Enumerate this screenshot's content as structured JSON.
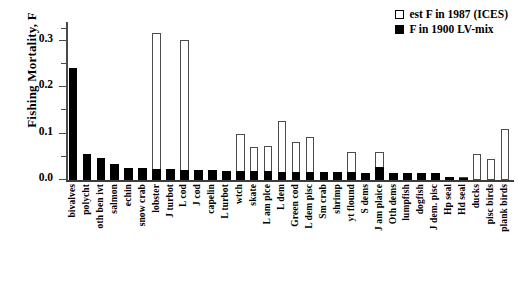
{
  "chart_data": {
    "type": "bar",
    "title": "",
    "xlabel": "",
    "ylabel": "Fishing Mortality, F",
    "ylim": [
      0,
      0.34
    ],
    "grid": false,
    "legend_position": "top-right",
    "ytick_labels": [
      "0.0",
      "0.1",
      "0.2",
      "0.3"
    ],
    "ytick_values": [
      0.0,
      0.1,
      0.2,
      0.3
    ],
    "categories": [
      "bivalves",
      "polycht",
      "oth ben ivt",
      "salmon",
      "echin",
      "snow crab",
      "lobster",
      "J turbot",
      "L cod",
      "J cod",
      "capelin",
      "L turbot",
      "wtch",
      "skate",
      "L am plce",
      "L dem",
      "Green cod",
      "L dem pisc",
      "Sm crab",
      "shrimp",
      "yt flound",
      "S dems",
      "J am plaice",
      "Oth dems",
      "lumpfish",
      "dogfish",
      "J dem. pisc",
      "Hp seal",
      "Hd seal",
      "ducks",
      "pisc birds",
      "plank birds"
    ],
    "series": [
      {
        "name": "est F in 1987 (ICES)",
        "style": "open",
        "values": [
          0.0,
          0.0,
          0.0,
          0.0,
          0.0,
          0.0,
          0.317,
          0.0,
          0.302,
          0.0,
          0.02,
          0.0,
          0.098,
          0.07,
          0.074,
          0.126,
          0.082,
          0.092,
          0.0,
          0.0,
          0.06,
          0.0,
          0.06,
          0.0,
          0.0,
          0.0,
          0.0,
          0.006,
          0.007,
          0.055,
          0.046,
          0.11
        ]
      },
      {
        "name": "F in 1900 LV-mix",
        "style": "filled",
        "values": [
          0.24,
          0.057,
          0.048,
          0.035,
          0.025,
          0.025,
          0.024,
          0.023,
          0.022,
          0.022,
          0.021,
          0.02,
          0.02,
          0.019,
          0.019,
          0.018,
          0.018,
          0.018,
          0.017,
          0.017,
          0.017,
          0.016,
          0.028,
          0.016,
          0.016,
          0.016,
          0.015,
          0.006,
          0.005,
          0.0,
          0.0,
          0.0
        ]
      }
    ],
    "legend": [
      {
        "label": "est F in 1987 (ICES)",
        "swatch": "open"
      },
      {
        "label": "F in 1900 LV-mix",
        "swatch": "filled"
      }
    ]
  }
}
